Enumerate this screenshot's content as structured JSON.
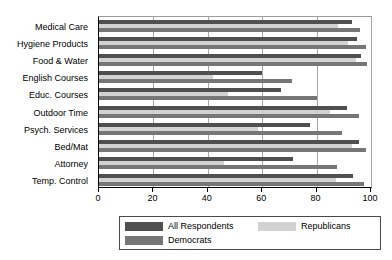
{
  "chart_data": {
    "type": "bar",
    "orientation": "horizontal",
    "title": "",
    "xlabel": "",
    "ylabel": "",
    "xlim": [
      0,
      100
    ],
    "xticks": [
      0,
      20,
      40,
      60,
      80,
      100
    ],
    "xtick_labels": [
      "0",
      "20",
      "40",
      "60",
      "80",
      "100"
    ],
    "grid": true,
    "grid_axis": "x",
    "legend_position": "bottom",
    "categories": [
      "Medical Care",
      "Hygiene Products",
      "Food & Water",
      "English Courses",
      "Educ. Courses",
      "Outdoor Time",
      "Psych. Services",
      "Bed/Mat",
      "Attorney",
      "Temp. Control"
    ],
    "series": [
      {
        "name": "All Respondents",
        "color": "#4f4f4f",
        "values": [
          93,
          95,
          96.5,
          60,
          67,
          91,
          77.5,
          95.5,
          71.5,
          93.5
        ]
      },
      {
        "name": "Republicans",
        "color": "#d2d2d2",
        "values": [
          88,
          91.5,
          94.5,
          42,
          47.5,
          85,
          58.5,
          93,
          46,
          87
        ]
      },
      {
        "name": "Democrats",
        "color": "#767676",
        "values": [
          96,
          98,
          98.5,
          71,
          80,
          95.5,
          89.5,
          98,
          87.5,
          97.5
        ]
      }
    ]
  },
  "legend": {
    "entries": [
      {
        "label": "All Respondents"
      },
      {
        "label": "Republicans"
      },
      {
        "label": "Democrats"
      }
    ]
  }
}
